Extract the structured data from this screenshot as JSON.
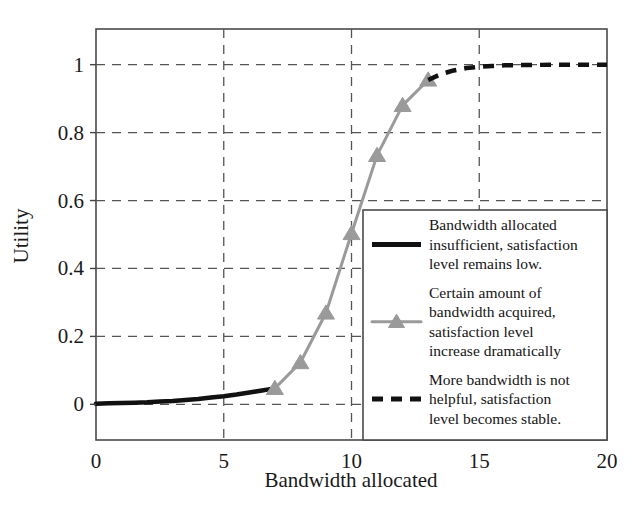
{
  "chart_data": {
    "type": "line",
    "title": "",
    "subtitle": "",
    "xlabel": "Bandwidth allocated",
    "ylabel": "Utility",
    "xlim": [
      0,
      20
    ],
    "ylim": [
      -0.105,
      1.105
    ],
    "grid": true,
    "xticks": [
      0,
      5,
      10,
      15,
      20
    ],
    "xtick_labels": [
      "0",
      "5",
      "10",
      "15",
      "20"
    ],
    "yticks": [
      0,
      0.2,
      0.4,
      0.6,
      0.8,
      1
    ],
    "ytick_labels": [
      "0",
      "0.2",
      "0.4",
      "0.6",
      "0.8",
      "1"
    ],
    "legend_position": "lower-right-inside",
    "series": [
      {
        "name": "Bandwidth allocated insufficient, satisfaction level remains low.",
        "style": "solid",
        "color": "#111111",
        "marker": "none",
        "linewidth": 4.5,
        "x": [
          0,
          0.5,
          1,
          1.5,
          2,
          2.5,
          3,
          3.5,
          4,
          4.5,
          5,
          5.5,
          6,
          6.25,
          6.5,
          6.75,
          7
        ],
        "y": [
          0.002,
          0.003,
          0.004,
          0.005,
          0.006,
          0.008,
          0.01,
          0.013,
          0.016,
          0.02,
          0.024,
          0.029,
          0.035,
          0.038,
          0.041,
          0.044,
          0.047
        ]
      },
      {
        "name": "Certain amount of bandwidth acquired, satisfaction level increase dramatically",
        "style": "solid",
        "color": "#9a9a9a",
        "marker": "triangle-up",
        "linewidth": 3.0,
        "x": [
          7,
          8,
          9,
          10,
          11,
          12,
          13
        ],
        "y": [
          0.047,
          0.123,
          0.269,
          0.503,
          0.733,
          0.88,
          0.955
        ]
      },
      {
        "name": "More bandwidth is not helpful, satisfaction level becomes stable.",
        "style": "dashed",
        "color": "#111111",
        "marker": "none",
        "linewidth": 4.5,
        "x": [
          13,
          13.5,
          14,
          14.5,
          15,
          15.5,
          16,
          17,
          18,
          19,
          20
        ],
        "y": [
          0.955,
          0.972,
          0.983,
          0.99,
          0.994,
          0.996,
          0.998,
          0.999,
          1.0,
          1.0,
          1.0
        ]
      }
    ]
  },
  "axes": {
    "y_axis_title": "Utility",
    "x_axis_title": "Bandwidth allocated"
  },
  "legend": {
    "entries": [
      {
        "sample": "solid-black-line",
        "lines": [
          "Bandwidth allocated",
          "insufficient, satisfaction",
          "level remains low."
        ]
      },
      {
        "sample": "gray-line-triangle-marker",
        "lines": [
          "Certain amount of",
          "bandwidth acquired,",
          "satisfaction level",
          "increase dramatically"
        ]
      },
      {
        "sample": "dashed-black-line",
        "lines": [
          "More bandwidth is not",
          "helpful, satisfaction",
          "level becomes stable."
        ]
      }
    ]
  },
  "colors": {
    "series_black": "#111111",
    "series_gray": "#9a9a9a",
    "grid": "#555555",
    "axis": "#444444",
    "background": "#ffffff"
  }
}
